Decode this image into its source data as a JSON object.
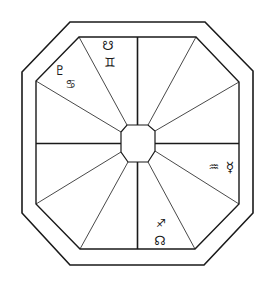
{
  "diagram": {
    "colors": {
      "line": "#1a1a1a",
      "background": "#ffffff"
    },
    "houses": 12,
    "placements": [
      {
        "id": "house-top-left-upper",
        "glyphs": [
          {
            "name": "south-node",
            "char": "☋",
            "x": 108,
            "y": 45,
            "size": 13
          },
          {
            "name": "gemini",
            "char": "♊",
            "x": 110,
            "y": 62,
            "size": 13
          }
        ]
      },
      {
        "id": "house-top-left-lower",
        "glyphs": [
          {
            "name": "pluto",
            "char": "♇",
            "x": 60,
            "y": 70,
            "size": 13
          },
          {
            "name": "cancer",
            "char": "♋",
            "x": 71,
            "y": 84,
            "size": 12
          }
        ]
      },
      {
        "id": "house-right-lower",
        "glyphs": [
          {
            "name": "aquarius",
            "char": "♒",
            "x": 214,
            "y": 167,
            "size": 12
          },
          {
            "name": "mercury",
            "char": "☿",
            "x": 230,
            "y": 167,
            "size": 14
          }
        ]
      },
      {
        "id": "house-bottom-right",
        "glyphs": [
          {
            "name": "sagittarius",
            "char": "♐",
            "x": 161,
            "y": 223,
            "size": 11
          },
          {
            "name": "north-node",
            "char": "☊",
            "x": 160,
            "y": 240,
            "size": 13
          }
        ]
      }
    ]
  }
}
